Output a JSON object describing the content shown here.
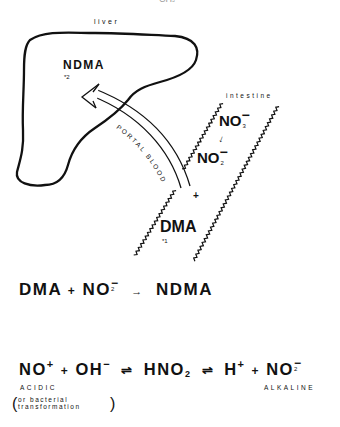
{
  "top_fragment": {
    "text": "CH",
    "sub": "3"
  },
  "liver": {
    "label": "liver",
    "compound": "NDMA",
    "note": "*2"
  },
  "portal_blood": {
    "label": "PORTAL BLOOD"
  },
  "intestine": {
    "label": "intestine",
    "nitrate": {
      "base": "NO",
      "sub": "3",
      "charge": "−"
    },
    "conversion_arrow": "↓",
    "nitrite": {
      "base": "NO",
      "sub": "2",
      "charge": "−"
    },
    "plus": "+",
    "compound": "DMA",
    "note": "*1"
  },
  "equation1": {
    "reactant1": "DMA",
    "plus": "+",
    "reactant2_base": "NO",
    "reactant2_sub": "2",
    "reactant2_charge": "−",
    "arrow": "→",
    "product": "NDMA"
  },
  "equation2": {
    "t1_base": "NO",
    "t1_charge": "+",
    "plus1": "+",
    "t2_base": "OH",
    "t2_charge": "−",
    "eq1": "⇌",
    "t3_base": "HNO",
    "t3_sub": "2",
    "eq2": "⇌",
    "t4_base": "H",
    "t4_charge": "+",
    "plus2": "+",
    "t5_base": "NO",
    "t5_sub": "2",
    "t5_charge": "−",
    "left_condition": "ACIDIC",
    "right_condition": "ALKALINE",
    "note_line1": "or bacterial",
    "note_line2": "transformation"
  }
}
